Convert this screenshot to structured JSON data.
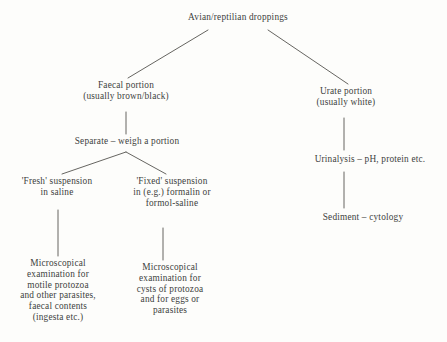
{
  "diagram": {
    "line_color": "#55534f",
    "text_color": "#403f3d",
    "background_color": "#fdfdfb"
  },
  "nodes": {
    "root": "Avian/reptilian droppings",
    "faecal": "Faecal portion\n(usually brown/black)",
    "urate": "Urate portion\n(usually white)",
    "separate": "Separate – weigh a portion",
    "fresh": "'Fresh' suspension\nin saline",
    "fixed": "'Fixed' suspension\nin (e.g.) formalin or\nformol-saline",
    "micro_motile": "Microscopical\nexamination for\nmotile protozoa\nand other parasites,\nfaecal contents\n(ingesta etc.)",
    "micro_cysts": "Microscopical\nexamination for\ncysts of protozoa\nand for eggs or\nparasites",
    "urinalysis": "Urinalysis – pH, protein etc.",
    "sediment": "Sediment – cytology"
  },
  "edges": [
    {
      "name": "root-to-faecal",
      "x1": 208,
      "y1": 30,
      "x2": 128,
      "y2": 78
    },
    {
      "name": "root-to-urate",
      "x1": 268,
      "y1": 30,
      "x2": 348,
      "y2": 84
    },
    {
      "name": "faecal-to-separate",
      "x1": 126,
      "y1": 112,
      "x2": 126,
      "y2": 134
    },
    {
      "name": "separate-to-fresh",
      "x1": 126,
      "y1": 152,
      "x2": 62,
      "y2": 174
    },
    {
      "name": "separate-to-fixed",
      "x1": 126,
      "y1": 152,
      "x2": 166,
      "y2": 174
    },
    {
      "name": "fresh-to-micro-motile",
      "x1": 58,
      "y1": 210,
      "x2": 58,
      "y2": 256
    },
    {
      "name": "fixed-to-micro-cysts",
      "x1": 163,
      "y1": 228,
      "x2": 163,
      "y2": 260
    },
    {
      "name": "urate-to-urinalysis",
      "x1": 344,
      "y1": 118,
      "x2": 344,
      "y2": 150
    },
    {
      "name": "urinalysis-to-sediment",
      "x1": 344,
      "y1": 172,
      "x2": 344,
      "y2": 208
    }
  ]
}
